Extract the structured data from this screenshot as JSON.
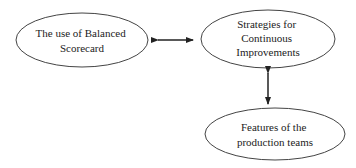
{
  "diagram": {
    "nodes": [
      {
        "id": "balanced-scorecard",
        "lines": [
          "The use of Balanced",
          "Scorecard"
        ]
      },
      {
        "id": "continuous-improvements",
        "lines": [
          "Strategies for",
          "Continuous",
          "Improvements"
        ]
      },
      {
        "id": "production-teams",
        "lines": [
          "Features of the",
          "production teams"
        ]
      }
    ],
    "edges": [
      {
        "from": "balanced-scorecard",
        "to": "continuous-improvements",
        "type": "bidirectional"
      },
      {
        "from": "continuous-improvements",
        "to": "production-teams",
        "type": "bidirectional"
      }
    ],
    "colors": {
      "stroke": "#333333",
      "text": "#222222",
      "background": "#ffffff"
    }
  }
}
